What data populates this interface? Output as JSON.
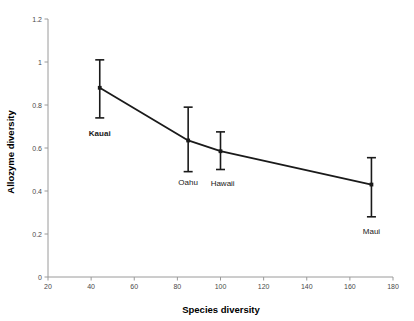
{
  "chart_data": {
    "type": "line",
    "title": "",
    "subtitle": "",
    "xlabel": "Species diversity",
    "ylabel": "Allozyme diversity",
    "xlim": [
      20,
      180
    ],
    "ylim": [
      0,
      1.2
    ],
    "xticks": [
      20,
      40,
      60,
      80,
      100,
      120,
      140,
      160,
      180
    ],
    "xtick_labels": [
      "20",
      "40",
      "60",
      "80",
      "100",
      "120",
      "140",
      "160",
      "180"
    ],
    "yticks": [
      0,
      0.2,
      0.4,
      0.6,
      0.8,
      1,
      1.2
    ],
    "ytick_labels": [
      "0",
      "0.2",
      "0.4",
      "0.6",
      "0.8",
      "1",
      "1.2"
    ],
    "grid": false,
    "legend": null,
    "legend_position": "none",
    "series": [
      {
        "name": "Hawaiian islands",
        "x": [
          44,
          85,
          100,
          170
        ],
        "values": [
          0.88,
          0.635,
          0.585,
          0.43
        ],
        "error_low": [
          0.74,
          0.49,
          0.5,
          0.28
        ],
        "error_high": [
          1.01,
          0.79,
          0.675,
          0.555
        ],
        "point_labels": [
          "Kauai",
          "Oahu",
          "Hawaii",
          "Maui"
        ]
      }
    ],
    "annotations": [
      {
        "text": "Kauai",
        "x": 44,
        "y": 0.655,
        "bold": true
      },
      {
        "text": "Oahu",
        "x": 85,
        "y": 0.43,
        "bold": false
      },
      {
        "text": "Hawaii",
        "x": 101,
        "y": 0.425,
        "bold": false
      },
      {
        "text": "Maui",
        "x": 170,
        "y": 0.2,
        "bold": false
      }
    ],
    "colors": {
      "line": "#1a1a1a",
      "marker": "#1a1a1a",
      "errorbar": "#1a1a1a",
      "axis": "#9a9a9a",
      "tick_text": "#4a4a4a",
      "background": "#ffffff"
    }
  }
}
